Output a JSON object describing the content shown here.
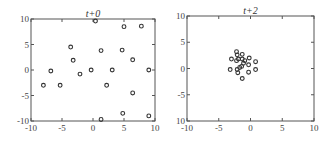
{
  "chart_data": [
    {
      "type": "scatter",
      "title": "t+0",
      "xlabel": "",
      "ylabel": "",
      "xlim": [
        -10,
        10
      ],
      "ylim": [
        -10,
        10
      ],
      "xticks": [
        -10,
        -5,
        0,
        5,
        10
      ],
      "yticks": [
        10,
        5,
        0,
        -5,
        -10
      ],
      "xtick_labels": [
        "-10",
        "-5",
        "0",
        "5",
        "10"
      ],
      "ytick_labels": [
        "10",
        "5",
        "0",
        "-5",
        "-10"
      ],
      "grid": false,
      "marker": "open-circle",
      "points": [
        [
          0.4,
          9.6
        ],
        [
          5.0,
          8.5
        ],
        [
          7.8,
          8.6
        ],
        [
          -3.6,
          4.5
        ],
        [
          1.3,
          3.8
        ],
        [
          4.7,
          3.9
        ],
        [
          -3.2,
          1.9
        ],
        [
          6.4,
          2.0
        ],
        [
          -6.8,
          -0.2
        ],
        [
          -0.3,
          0.0
        ],
        [
          3.1,
          0.0
        ],
        [
          9.0,
          0.0
        ],
        [
          -2.1,
          -0.8
        ],
        [
          -8.0,
          -3.0
        ],
        [
          -5.3,
          -3.0
        ],
        [
          2.2,
          -3.0
        ],
        [
          6.4,
          -4.5
        ],
        [
          4.8,
          -8.5
        ],
        [
          9.0,
          -9.0
        ],
        [
          1.3,
          -9.7
        ]
      ]
    },
    {
      "type": "scatter",
      "title": "t+2",
      "xlabel": "",
      "ylabel": "",
      "xlim": [
        -10,
        10
      ],
      "ylim": [
        -10,
        10
      ],
      "xticks": [
        -10,
        -5,
        0,
        5,
        10
      ],
      "yticks": [
        10,
        5,
        0,
        -5,
        -10
      ],
      "xtick_labels": [
        "-10",
        "-5",
        "0",
        "5",
        "10"
      ],
      "ytick_labels": [
        "10",
        "5",
        "0",
        "-5",
        "10"
      ],
      "grid": false,
      "marker": "open-circle",
      "points": [
        [
          -3.0,
          1.8
        ],
        [
          -2.2,
          3.2
        ],
        [
          -2.1,
          2.6
        ],
        [
          -1.3,
          2.7
        ],
        [
          -1.9,
          1.8
        ],
        [
          -1.3,
          1.8
        ],
        [
          -0.2,
          2.0
        ],
        [
          0.8,
          1.3
        ],
        [
          -2.2,
          1.5
        ],
        [
          -1.1,
          1.0
        ],
        [
          -0.3,
          0.7
        ],
        [
          -1.4,
          0.4
        ],
        [
          -3.2,
          -0.2
        ],
        [
          -2.1,
          -0.2
        ],
        [
          -2.0,
          -0.8
        ],
        [
          -0.3,
          -0.7
        ],
        [
          0.8,
          -0.2
        ],
        [
          -1.3,
          -1.9
        ],
        [
          -0.9,
          1.5
        ],
        [
          -1.7,
          0.2
        ]
      ]
    }
  ],
  "panels": [
    {
      "title": "t+0"
    },
    {
      "title": "t+2"
    }
  ]
}
